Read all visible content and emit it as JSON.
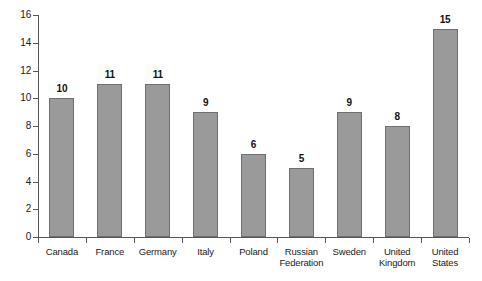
{
  "chart_data": {
    "type": "bar",
    "title": "",
    "subtitle": "",
    "xlabel": "",
    "ylabel": "",
    "categories": [
      "Canada",
      "France",
      "Germany",
      "Italy",
      "Poland",
      "Russian Federation",
      "Sweden",
      "United Kingdom",
      "United States"
    ],
    "category_lines": [
      [
        "Canada"
      ],
      [
        "France"
      ],
      [
        "Germany"
      ],
      [
        "Italy"
      ],
      [
        "Poland"
      ],
      [
        "Russian",
        "Federation"
      ],
      [
        "Sweden"
      ],
      [
        "United",
        "Kingdom"
      ],
      [
        "United",
        "States"
      ]
    ],
    "values": [
      10,
      11,
      11,
      9,
      6,
      5,
      9,
      8,
      15
    ],
    "value_labels": [
      "10",
      "11",
      "11",
      "9",
      "6",
      "5",
      "9",
      "8",
      "15"
    ],
    "ylim": [
      0,
      16
    ],
    "ytick_values": [
      0,
      2,
      4,
      6,
      8,
      10,
      12,
      14,
      16
    ],
    "ytick_labels": [
      "0",
      "2",
      "4",
      "6",
      "8",
      "10",
      "12",
      "14",
      "16"
    ],
    "grid": false,
    "legend": null,
    "legend_position": "none",
    "bar_color": "#9a9a9a",
    "bar_border_color": "#6f6f6f",
    "axis_color": "#555555",
    "text_color": "#1a1a1a",
    "background_color": "#ffffff"
  }
}
